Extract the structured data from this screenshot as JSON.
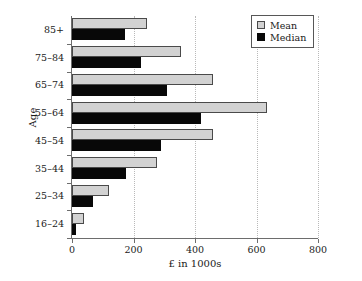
{
  "chart_data": {
    "type": "bar",
    "orientation": "horizontal",
    "title": "",
    "xlabel": "£ in 1000s",
    "ylabel": "Age",
    "categories": [
      "16–24",
      "25–34",
      "35–44",
      "45–54",
      "55–64",
      "65–74",
      "75–84",
      "85+"
    ],
    "series": [
      {
        "name": "Mean",
        "color": "#d2d2d2",
        "values": [
          40,
          120,
          278,
          458,
          635,
          460,
          355,
          245
        ]
      },
      {
        "name": "Median",
        "color": "#080808",
        "values": [
          12,
          68,
          175,
          288,
          418,
          310,
          225,
          172
        ]
      }
    ],
    "xlim": [
      0,
      800
    ],
    "xticks": [
      0,
      200,
      400,
      600,
      800
    ],
    "xtick_labels": [
      "0",
      "200",
      "400",
      "600",
      "800"
    ],
    "grid": "vertical-dotted",
    "legend_position": "top-right",
    "legend_entries": [
      "Mean",
      "Median"
    ]
  }
}
